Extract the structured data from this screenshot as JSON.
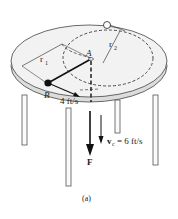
{
  "figure": {
    "caption": "(a)",
    "labels": {
      "point_a": "A",
      "point_b": "B",
      "radius_1": "r",
      "radius_1_sub": "1",
      "radius_2": "r",
      "radius_2_sub": "2",
      "speed_b": "4 ft/s",
      "velocity_c": "v",
      "velocity_c_sub": "c",
      "velocity_c_value": "= 6 ft/s",
      "force": "F"
    },
    "colors": {
      "table_top": "#f2f2f2",
      "table_edge": "#d9d9d9",
      "line": "#222222",
      "particle": "#222222"
    }
  }
}
